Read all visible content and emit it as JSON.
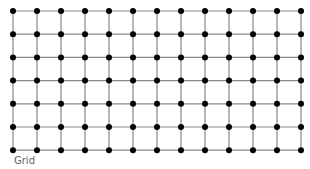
{
  "caption": "Grid",
  "grid": {
    "columns": 13,
    "rows": 7,
    "origin_x": 13,
    "origin_y": 11,
    "spacing_x": 24,
    "spacing_y": 23.2,
    "node_radius": 3,
    "node_color": "#000000",
    "edge_color": "#888888"
  }
}
